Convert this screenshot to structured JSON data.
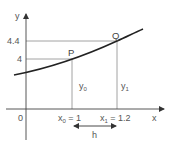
{
  "diagram": {
    "axes": {
      "x_label": "x",
      "y_label": "y",
      "origin_label": "0"
    },
    "y_ticks": [
      {
        "label": "4.4",
        "value": 4.4
      },
      {
        "label": "4",
        "value": 4
      }
    ],
    "points": [
      {
        "name": "P",
        "x": 1,
        "y": 4
      },
      {
        "name": "Q",
        "x": 1.2,
        "y": 4.4
      }
    ],
    "x_markers": [
      {
        "var": "x",
        "sub": "0",
        "rest": " = 1"
      },
      {
        "var": "x",
        "sub": "1",
        "rest": " = 1.2"
      }
    ],
    "ordinates": [
      {
        "var": "y",
        "sub": "0"
      },
      {
        "var": "y",
        "sub": "1"
      }
    ],
    "interval_label": "h",
    "colors": {
      "curve": "#222222",
      "axes": "#444444",
      "guides": "#888888",
      "text": "#555555"
    }
  }
}
